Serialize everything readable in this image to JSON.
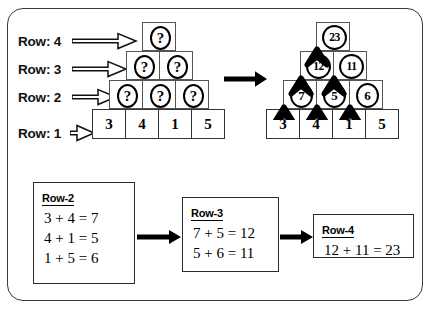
{
  "figure": {
    "frame_color": "#3a3a3a",
    "background": "#ffffff"
  },
  "row_labels": [
    {
      "text": "Row: 4",
      "icon": "hollow-right-arrow-icon"
    },
    {
      "text": "Row: 3",
      "icon": "hollow-right-arrow-icon"
    },
    {
      "text": "Row: 2",
      "icon": "hollow-right-arrow-icon"
    },
    {
      "text": "Row: 1",
      "icon": "hollow-right-arrow-icon"
    }
  ],
  "pyramid_left": {
    "caption": "unsolved pyramid",
    "rows": [
      {
        "row": 4,
        "cells": [
          {
            "value": "?",
            "shape": "circle"
          }
        ]
      },
      {
        "row": 3,
        "cells": [
          {
            "value": "?",
            "shape": "circle"
          },
          {
            "value": "?",
            "shape": "circle"
          }
        ]
      },
      {
        "row": 2,
        "cells": [
          {
            "value": "?",
            "shape": "circle"
          },
          {
            "value": "?",
            "shape": "circle"
          },
          {
            "value": "?",
            "shape": "circle"
          }
        ]
      },
      {
        "row": 1,
        "cells": [
          {
            "value": "3",
            "shape": "box"
          },
          {
            "value": "4",
            "shape": "box"
          },
          {
            "value": "1",
            "shape": "box"
          },
          {
            "value": "5",
            "shape": "box"
          }
        ]
      }
    ]
  },
  "pyramid_right": {
    "caption": "solved pyramid",
    "rows": [
      {
        "row": 4,
        "cells": [
          {
            "value": "23",
            "shape": "circle"
          }
        ]
      },
      {
        "row": 3,
        "cells": [
          {
            "value": "12",
            "shape": "circle"
          },
          {
            "value": "11",
            "shape": "circle"
          }
        ]
      },
      {
        "row": 2,
        "cells": [
          {
            "value": "7",
            "shape": "circle"
          },
          {
            "value": "5",
            "shape": "circle"
          },
          {
            "value": "6",
            "shape": "circle"
          }
        ]
      },
      {
        "row": 1,
        "cells": [
          {
            "value": "3",
            "shape": "box"
          },
          {
            "value": "4",
            "shape": "box"
          },
          {
            "value": "1",
            "shape": "box"
          },
          {
            "value": "5",
            "shape": "box"
          }
        ]
      }
    ]
  },
  "transition_arrow": {
    "icon": "solid-right-arrow-icon"
  },
  "equation_boxes": [
    {
      "title": "Row-2",
      "lines": [
        "3 + 4 = 7",
        "4 + 1 = 5",
        "1 + 5 = 6"
      ]
    },
    {
      "title": "Row-3",
      "lines": [
        "7 + 5 = 12",
        "5 + 6 = 11"
      ]
    },
    {
      "title": "Row-4",
      "lines": [
        "12 + 11 = 23"
      ]
    }
  ],
  "flow_arrows": [
    {
      "icon": "solid-right-arrow-icon",
      "from": "Row-2",
      "to": "Row-3"
    },
    {
      "icon": "solid-right-arrow-icon",
      "from": "Row-3",
      "to": "Row-4"
    }
  ]
}
